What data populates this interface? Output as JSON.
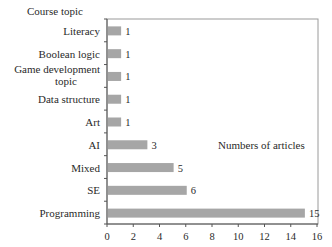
{
  "chart_data": {
    "type": "bar",
    "orientation": "horizontal",
    "title": "",
    "ylabel": "Course topic",
    "xlabel": "Numbers of articles",
    "categories": [
      "Literacy",
      "Boolean logic",
      "Game development topic",
      "Data structure",
      "Art",
      "AI",
      "Mixed",
      "SE",
      "Programming"
    ],
    "category_display": [
      [
        "Literacy"
      ],
      [
        "Boolean logic"
      ],
      [
        "Game development",
        "topic"
      ],
      [
        "Data structure"
      ],
      [
        "Art"
      ],
      [
        "AI"
      ],
      [
        "Mixed"
      ],
      [
        "SE"
      ],
      [
        "Programming"
      ]
    ],
    "values": [
      1,
      1,
      1,
      1,
      1,
      3,
      5,
      6,
      15
    ],
    "value_labels": [
      "1",
      "1",
      "1",
      "1",
      "1",
      "3",
      "5",
      "6",
      "15"
    ],
    "xlim": [
      0,
      16
    ],
    "x_ticks": [
      0,
      2,
      4,
      6,
      8,
      10,
      12,
      14,
      16
    ],
    "grid": false,
    "legend": null,
    "colors": {
      "bar": "#a6a6a6",
      "axis": "#555555",
      "frame": "#9a9a9a"
    }
  }
}
